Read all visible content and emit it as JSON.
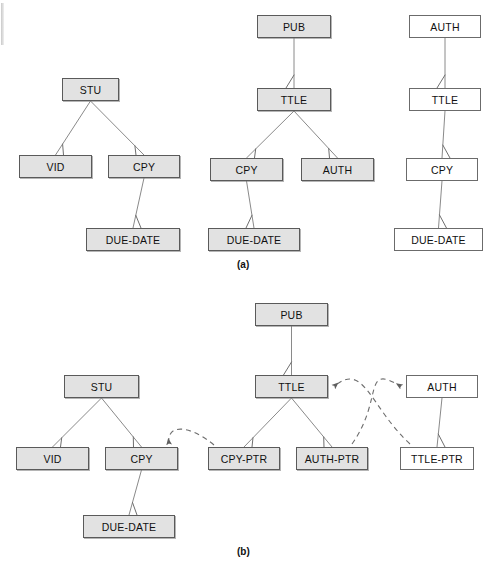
{
  "figure": {
    "caption_a": "(a)",
    "caption_b": "(b)",
    "colors": {
      "shaded_fill": "#e2e2e2",
      "plain_fill": "#ffffff",
      "stroke": "#6f6f6f",
      "line": "#8a8a8a",
      "dashed": "#6e6e6e"
    }
  },
  "part_a": {
    "label": "(a)",
    "tree_student": {
      "name": "student-tree",
      "nodes": [
        {
          "id": "a-stu",
          "label": "STU",
          "style": "shaded",
          "x": 62,
          "y": 78,
          "w": 57,
          "h": 23
        },
        {
          "id": "a-vid",
          "label": "VID",
          "style": "shaded",
          "x": 19,
          "y": 155,
          "w": 73,
          "h": 23
        },
        {
          "id": "a-cpy",
          "label": "CPY",
          "style": "shaded",
          "x": 108,
          "y": 155,
          "w": 72,
          "h": 23
        },
        {
          "id": "a-due",
          "label": "DUE-DATE",
          "style": "shaded",
          "x": 86,
          "y": 228,
          "w": 94,
          "h": 23
        }
      ],
      "links": [
        {
          "from": "a-stu",
          "to": "a-vid"
        },
        {
          "from": "a-stu",
          "to": "a-cpy"
        },
        {
          "from": "a-cpy",
          "to": "a-due"
        }
      ]
    },
    "tree_publisher": {
      "name": "publisher-tree",
      "nodes": [
        {
          "id": "a-pub",
          "label": "PUB",
          "style": "shaded",
          "x": 257,
          "y": 15,
          "w": 74,
          "h": 23
        },
        {
          "id": "a-ttle",
          "label": "TTLE",
          "style": "shaded",
          "x": 257,
          "y": 88,
          "w": 74,
          "h": 23
        },
        {
          "id": "a-cpy2",
          "label": "CPY",
          "style": "shaded",
          "x": 210,
          "y": 158,
          "w": 73,
          "h": 23
        },
        {
          "id": "a-auth",
          "label": "AUTH",
          "style": "shaded",
          "x": 301,
          "y": 158,
          "w": 73,
          "h": 23
        },
        {
          "id": "a-due2",
          "label": "DUE-DATE",
          "style": "shaded",
          "x": 208,
          "y": 228,
          "w": 92,
          "h": 23
        }
      ],
      "links": [
        {
          "from": "a-pub",
          "to": "a-ttle"
        },
        {
          "from": "a-ttle",
          "to": "a-cpy2"
        },
        {
          "from": "a-ttle",
          "to": "a-auth"
        },
        {
          "from": "a-cpy2",
          "to": "a-due2"
        }
      ]
    },
    "tree_author": {
      "name": "author-tree",
      "nodes": [
        {
          "id": "a-auth2",
          "label": "AUTH",
          "style": "plain",
          "x": 409,
          "y": 15,
          "w": 72,
          "h": 23
        },
        {
          "id": "a-ttle2",
          "label": "TTLE",
          "style": "plain",
          "x": 409,
          "y": 88,
          "w": 72,
          "h": 23
        },
        {
          "id": "a-cpy3",
          "label": "CPY",
          "style": "plain",
          "x": 406,
          "y": 158,
          "w": 72,
          "h": 23
        },
        {
          "id": "a-due3",
          "label": "DUE-DATE",
          "style": "plain",
          "x": 394,
          "y": 228,
          "w": 89,
          "h": 23
        }
      ],
      "links": [
        {
          "from": "a-auth2",
          "to": "a-ttle2"
        },
        {
          "from": "a-ttle2",
          "to": "a-cpy3"
        },
        {
          "from": "a-cpy3",
          "to": "a-due3"
        }
      ]
    }
  },
  "part_b": {
    "label": "(b)",
    "nodes": [
      {
        "id": "b-stu",
        "label": "STU",
        "style": "shaded",
        "x": 64,
        "y": 375,
        "w": 75,
        "h": 23
      },
      {
        "id": "b-vid",
        "label": "VID",
        "style": "shaded",
        "x": 16,
        "y": 447,
        "w": 73,
        "h": 23
      },
      {
        "id": "b-cpy",
        "label": "CPY",
        "style": "shaded",
        "x": 105,
        "y": 447,
        "w": 73,
        "h": 23
      },
      {
        "id": "b-due",
        "label": "DUE-DATE",
        "style": "shaded",
        "x": 83,
        "y": 515,
        "w": 92,
        "h": 23
      },
      {
        "id": "b-pub",
        "label": "PUB",
        "style": "shaded",
        "x": 255,
        "y": 303,
        "w": 73,
        "h": 23
      },
      {
        "id": "b-ttle",
        "label": "TTLE",
        "style": "shaded",
        "x": 255,
        "y": 375,
        "w": 73,
        "h": 23
      },
      {
        "id": "b-cpyptr",
        "label": "CPY-PTR",
        "style": "shaded",
        "x": 208,
        "y": 447,
        "w": 72,
        "h": 23
      },
      {
        "id": "b-authptr",
        "label": "AUTH-PTR",
        "style": "shaded",
        "x": 296,
        "y": 447,
        "w": 72,
        "h": 23
      },
      {
        "id": "b-auth",
        "label": "AUTH",
        "style": "plain",
        "x": 406,
        "y": 375,
        "w": 72,
        "h": 23
      },
      {
        "id": "b-ttleptr",
        "label": "TTLE-PTR",
        "style": "plain",
        "x": 400,
        "y": 447,
        "w": 74,
        "h": 23
      }
    ],
    "links": [
      {
        "from": "b-stu",
        "to": "b-vid"
      },
      {
        "from": "b-stu",
        "to": "b-cpy"
      },
      {
        "from": "b-cpy",
        "to": "b-due"
      },
      {
        "from": "b-pub",
        "to": "b-ttle"
      },
      {
        "from": "b-ttle",
        "to": "b-cpyptr"
      },
      {
        "from": "b-ttle",
        "to": "b-authptr"
      },
      {
        "from": "b-auth",
        "to": "b-ttleptr"
      }
    ],
    "pointer_links": [
      {
        "id": "p1",
        "from": "b-cpyptr",
        "to": "b-cpy",
        "name": "cpy-ptr-to-cpy-arrow"
      },
      {
        "id": "p2",
        "from": "b-authptr",
        "to": "b-auth",
        "name": "auth-ptr-to-auth-arrow"
      },
      {
        "id": "p3",
        "from": "b-ttleptr",
        "to": "b-ttle",
        "name": "ttle-ptr-to-ttle-arrow"
      }
    ]
  }
}
